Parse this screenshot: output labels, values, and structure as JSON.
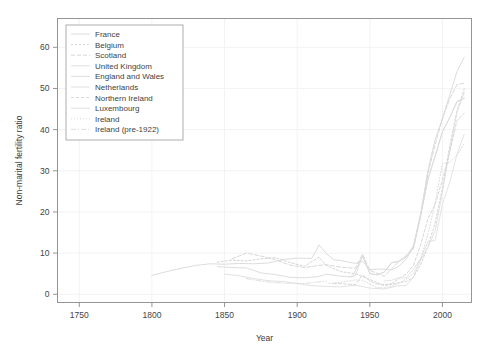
{
  "chart_data": {
    "type": "line",
    "title": "",
    "xlabel": "Year",
    "ylabel": "Non-marital fertility ratio",
    "xlim": [
      1735,
      2020
    ],
    "ylim": [
      -2,
      67
    ],
    "xticks": [
      1750,
      1800,
      1850,
      1900,
      1950,
      2000
    ],
    "yticks": [
      0,
      10,
      20,
      30,
      40,
      50,
      60
    ],
    "grid": true,
    "legend_position": "top-left",
    "series": [
      {
        "name": "France",
        "color": "#d8d8d8",
        "dash": "none",
        "x": [
          1800,
          1810,
          1820,
          1830,
          1840,
          1850,
          1860,
          1870,
          1880,
          1890,
          1900,
          1910,
          1915,
          1920,
          1925,
          1930,
          1940,
          1945,
          1950,
          1955,
          1960,
          1965,
          1970,
          1975,
          1980,
          1985,
          1990,
          1995,
          2000,
          2005,
          2010,
          2015
        ],
        "y": [
          4.6,
          5.5,
          6.3,
          7.0,
          7.4,
          7.3,
          7.5,
          7.4,
          7.6,
          8.4,
          8.8,
          8.7,
          12.0,
          9.9,
          8.4,
          8.2,
          7.5,
          8.0,
          6.0,
          6.1,
          6.1,
          5.9,
          6.8,
          8.5,
          11.4,
          19.6,
          30.1,
          37.6,
          42.6,
          48.4,
          54.1,
          57.6
        ]
      },
      {
        "name": "Belgium",
        "color": "#cfcfcf",
        "dash": "2,2",
        "x": [
          1845,
          1855,
          1865,
          1875,
          1885,
          1895,
          1905,
          1915,
          1920,
          1930,
          1940,
          1950,
          1960,
          1970,
          1975,
          1980,
          1985,
          1990,
          1995,
          2000,
          2005,
          2010,
          2015
        ],
        "y": [
          7.8,
          8.3,
          8.1,
          8.6,
          8.9,
          7.7,
          6.8,
          9.0,
          7.0,
          5.5,
          5.0,
          3.6,
          2.1,
          2.8,
          3.1,
          4.1,
          7.1,
          11.6,
          17.3,
          25.8,
          36.0,
          44.5,
          49.9
        ]
      },
      {
        "name": "Scotland",
        "color": "#d4d4d4",
        "dash": "4,2",
        "x": [
          1855,
          1865,
          1875,
          1885,
          1895,
          1905,
          1915,
          1920,
          1930,
          1940,
          1945,
          1950,
          1960,
          1970,
          1975,
          1980,
          1985,
          1990,
          1995,
          2000,
          2005,
          2010,
          2015
        ],
        "y": [
          8.6,
          10.0,
          9.3,
          8.4,
          7.1,
          6.5,
          7.0,
          7.2,
          6.6,
          6.3,
          9.8,
          5.8,
          4.4,
          8.0,
          9.4,
          11.0,
          18.9,
          29.3,
          36.4,
          42.7,
          47.5,
          50.9,
          51.3
        ]
      },
      {
        "name": "United Kingdom",
        "color": "#dcdcdc",
        "dash": "none",
        "x": [
          1935,
          1940,
          1945,
          1950,
          1955,
          1960,
          1965,
          1970,
          1975,
          1980,
          1985,
          1990,
          1995,
          2000,
          2005,
          2010,
          2015
        ],
        "y": [
          4.3,
          4.5,
          9.3,
          5.1,
          4.7,
          5.4,
          7.7,
          8.0,
          9.1,
          11.8,
          19.2,
          27.9,
          33.6,
          39.5,
          42.9,
          46.8,
          47.6
        ]
      },
      {
        "name": "England and Wales",
        "color": "#dadada",
        "dash": "none",
        "x": [
          1845,
          1855,
          1865,
          1875,
          1885,
          1895,
          1905,
          1915,
          1920,
          1930,
          1938,
          1945,
          1950,
          1955,
          1960,
          1965,
          1970,
          1975,
          1980,
          1985,
          1990,
          1995,
          2000,
          2005,
          2010,
          2015
        ],
        "y": [
          6.7,
          6.5,
          6.4,
          5.2,
          4.8,
          4.1,
          4.0,
          4.3,
          4.9,
          4.4,
          4.2,
          9.3,
          5.0,
          4.7,
          5.4,
          7.7,
          8.0,
          9.0,
          11.5,
          19.2,
          27.9,
          33.6,
          39.5,
          42.9,
          46.8,
          47.7
        ]
      },
      {
        "name": "Netherlands",
        "color": "#dedede",
        "dash": "none",
        "x": [
          1850,
          1860,
          1870,
          1880,
          1890,
          1900,
          1910,
          1920,
          1930,
          1940,
          1950,
          1960,
          1970,
          1975,
          1980,
          1985,
          1990,
          1995,
          2000,
          2005,
          2010,
          2015
        ],
        "y": [
          4.9,
          4.5,
          3.8,
          3.3,
          3.1,
          2.6,
          2.1,
          1.9,
          1.8,
          2.2,
          1.5,
          1.3,
          2.1,
          2.1,
          4.1,
          8.3,
          11.4,
          15.5,
          24.9,
          34.9,
          44.3,
          49.0
        ]
      },
      {
        "name": "Northern Ireland",
        "color": "#d2d2d2",
        "dash": "3,2",
        "x": [
          1925,
          1930,
          1940,
          1945,
          1950,
          1955,
          1960,
          1965,
          1970,
          1975,
          1980,
          1985,
          1990,
          1995,
          2000,
          2005,
          2010,
          2015
        ],
        "y": [
          2.6,
          2.6,
          2.3,
          4.7,
          3.2,
          2.5,
          2.3,
          2.6,
          3.8,
          4.9,
          7.0,
          12.0,
          18.3,
          21.9,
          27.8,
          34.5,
          42.2,
          44.0
        ]
      },
      {
        "name": "Luxembourg",
        "color": "#e0e0e0",
        "dash": "none",
        "x": [
          1960,
          1965,
          1970,
          1975,
          1980,
          1985,
          1990,
          1995,
          2000,
          2005,
          2010,
          2015
        ],
        "y": [
          3.2,
          3.4,
          4.0,
          4.0,
          6.0,
          8.7,
          12.8,
          13.1,
          21.9,
          27.2,
          34.0,
          38.9
        ]
      },
      {
        "name": "Ireland",
        "color": "#d6d6d6",
        "dash": "1,2",
        "x": [
          1922,
          1930,
          1940,
          1945,
          1950,
          1955,
          1960,
          1965,
          1970,
          1975,
          1980,
          1985,
          1990,
          1995,
          2000,
          2005,
          2010,
          2015
        ],
        "y": [
          2.6,
          2.9,
          3.5,
          3.4,
          2.5,
          1.6,
          1.6,
          2.0,
          2.7,
          3.7,
          5.0,
          8.5,
          14.6,
          22.2,
          31.8,
          32.0,
          33.8,
          36.6
        ]
      },
      {
        "name": "Ireland (pre-1922)",
        "color": "#dbdbdb",
        "dash": "5,2,1,2",
        "x": [
          1865,
          1875,
          1885,
          1895,
          1905,
          1915,
          1920
        ],
        "y": [
          3.8,
          3.2,
          2.8,
          2.7,
          2.6,
          3.0,
          3.2
        ]
      }
    ]
  },
  "axes": {
    "x_label": "Year",
    "y_label": "Non-marital fertility ratio",
    "x_tick_labels": [
      "1750",
      "1800",
      "1850",
      "1900",
      "1950",
      "2000"
    ],
    "y_tick_labels": [
      "0",
      "10",
      "20",
      "30",
      "40",
      "50",
      "60"
    ]
  },
  "legend": {
    "items": [
      {
        "label": "France"
      },
      {
        "label": "Belgium"
      },
      {
        "label": "Scotland"
      },
      {
        "label": "United Kingdom"
      },
      {
        "label": "England and Wales"
      },
      {
        "label": "Netherlands"
      },
      {
        "label": "Northern Ireland"
      },
      {
        "label": "Luxembourg"
      },
      {
        "label": "Ireland"
      },
      {
        "label": "Ireland (pre-1922)"
      }
    ]
  }
}
